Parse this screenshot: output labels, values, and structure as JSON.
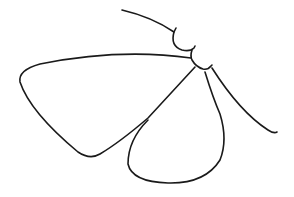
{
  "illustration": {
    "subject": "moth line drawing",
    "stroke_color": "#1a1a1a",
    "background_color": "#ffffff"
  }
}
